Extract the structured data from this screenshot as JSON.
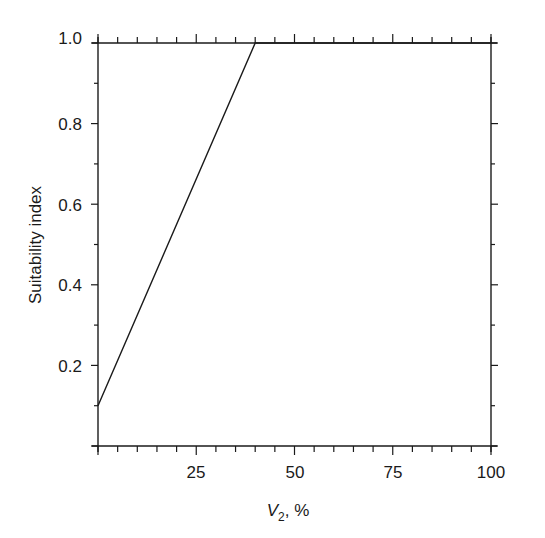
{
  "chart_data": {
    "type": "line",
    "title": "",
    "xlabel": "V2, %",
    "xlabel_parts": {
      "main": "V",
      "sub": "2",
      "rest": ", %"
    },
    "ylabel": "Suitability index",
    "xlim": [
      0,
      100
    ],
    "ylim": [
      0,
      1.0
    ],
    "x_ticks": [
      25,
      50,
      75,
      100
    ],
    "x_tick_labels": [
      "25",
      "50",
      "75",
      "100"
    ],
    "x_minor_step": 5,
    "y_ticks": [
      0.2,
      0.4,
      0.6,
      0.8,
      1.0
    ],
    "y_tick_labels": [
      "0.2",
      "0.4",
      "0.6",
      "0.8",
      "1.0"
    ],
    "y_minor_step": 0.1,
    "grid": false,
    "legend": null,
    "series": [
      {
        "name": "Suitability index vs V2",
        "x": [
          0,
          40,
          100
        ],
        "y": [
          0.1,
          1.0,
          1.0
        ]
      }
    ],
    "colors": {
      "line": "#1a1a1a",
      "background": "#ffffff"
    }
  }
}
